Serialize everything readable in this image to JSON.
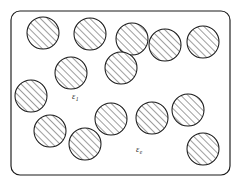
{
  "figure": {
    "type": "schematic-diagram",
    "background_color": "#ffffff",
    "line_color": "#1a1a1a",
    "hatch_color": "#1a1a1a",
    "label_color": "#2b2b2b"
  },
  "boundary": {
    "name": "host-medium-boundary",
    "shape": "rounded-rectangle",
    "x": 11,
    "y": 11,
    "width": 219,
    "height": 164,
    "corner_radius": 9,
    "stroke_width": 1.15,
    "fill": "#ffffff"
  },
  "hatch": {
    "angle_degrees": 45,
    "direction": "bottom-left to top-right",
    "spacing": 5,
    "stroke_width": 0.85
  },
  "labels": [
    {
      "name": "epsilon-1-label",
      "symbol": "ε",
      "subscript": "1",
      "meaning": "permittivity of the circular inclusions",
      "x": 72,
      "y": 99
    },
    {
      "name": "epsilon-e-label",
      "symbol": "ε",
      "subscript": "e",
      "meaning": "permittivity of the external host medium",
      "x": 136,
      "y": 152
    }
  ],
  "inclusions": {
    "count": 15,
    "radius": 16,
    "circles": [
      {
        "id": "inclusion-1",
        "cx": 43,
        "cy": 33,
        "r": 16
      },
      {
        "id": "inclusion-2",
        "cx": 90,
        "cy": 34,
        "r": 16
      },
      {
        "id": "inclusion-3",
        "cx": 132,
        "cy": 39,
        "r": 16
      },
      {
        "id": "inclusion-4",
        "cx": 165,
        "cy": 45,
        "r": 16
      },
      {
        "id": "inclusion-5",
        "cx": 203,
        "cy": 42,
        "r": 16
      },
      {
        "id": "inclusion-6",
        "cx": 71,
        "cy": 73,
        "r": 16
      },
      {
        "id": "inclusion-7",
        "cx": 121,
        "cy": 68,
        "r": 16
      },
      {
        "id": "inclusion-8",
        "cx": 31,
        "cy": 96,
        "r": 16
      },
      {
        "id": "inclusion-9",
        "cx": 188,
        "cy": 110,
        "r": 16
      },
      {
        "id": "inclusion-10",
        "cx": 111,
        "cy": 119,
        "r": 16
      },
      {
        "id": "inclusion-11",
        "cx": 152,
        "cy": 118,
        "r": 16
      },
      {
        "id": "inclusion-12",
        "cx": 50,
        "cy": 131,
        "r": 16
      },
      {
        "id": "inclusion-13",
        "cx": 85,
        "cy": 144,
        "r": 16
      },
      {
        "id": "inclusion-14",
        "cx": 203,
        "cy": 149,
        "r": 16
      }
    ]
  }
}
